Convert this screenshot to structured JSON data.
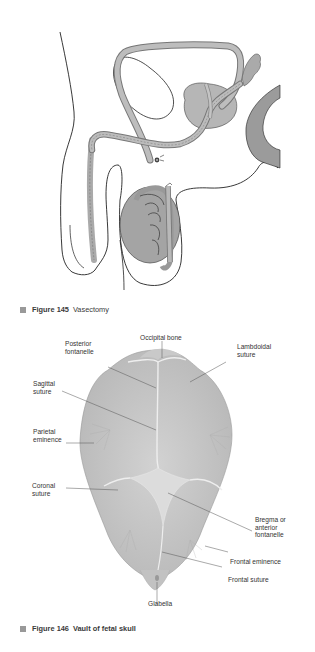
{
  "figure145": {
    "number": "Figure 145",
    "title": "Vasectomy"
  },
  "figure146": {
    "number": "Figure 146",
    "title": "Vault of fetal skull",
    "labels": {
      "posterior_fontanelle": "Posterior\nfontanelle",
      "occipital_bone": "Occipital bone",
      "lambdoidal_suture": "Lambdoidal\nsuture",
      "sagittal_suture": "Sagittal\nsuture",
      "parietal_eminence": "Parietal\neminence",
      "coronal_suture": "Coronal\nsuture",
      "bregma": "Bregma or\nanterior\nfontanelle",
      "frontal_eminence": "Frontal eminence",
      "frontal_suture": "Frontal suture",
      "glabella": "Glabella"
    }
  },
  "colors": {
    "organ_fill": "#a9a9a9",
    "tube_fill": "#b3b3b3",
    "skull_fill": "#c4c4c4",
    "caption_square": "#999999"
  }
}
